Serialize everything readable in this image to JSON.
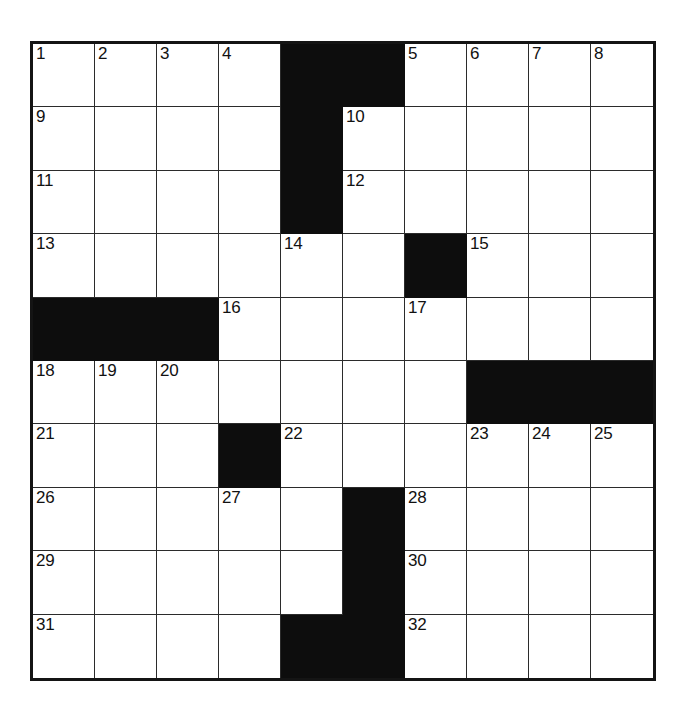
{
  "puzzle": {
    "title": "Crossword Grid",
    "type": "crossword-grid",
    "columns": 10,
    "rows": 10,
    "total_clue_numbers": 32,
    "colors": {
      "cell_fill": "#ffffff",
      "block_fill": "#0d0d0d",
      "grid_line": "#2b2b2b",
      "border": "#141414",
      "number_text": "#111111",
      "page_background": "#ffffff"
    },
    "grid": [
      [
        {
          "block": false,
          "number": "1"
        },
        {
          "block": false,
          "number": "2"
        },
        {
          "block": false,
          "number": "3"
        },
        {
          "block": false,
          "number": "4"
        },
        {
          "block": true,
          "number": ""
        },
        {
          "block": true,
          "number": ""
        },
        {
          "block": false,
          "number": "5"
        },
        {
          "block": false,
          "number": "6"
        },
        {
          "block": false,
          "number": "7"
        },
        {
          "block": false,
          "number": "8"
        }
      ],
      [
        {
          "block": false,
          "number": "9"
        },
        {
          "block": false,
          "number": ""
        },
        {
          "block": false,
          "number": ""
        },
        {
          "block": false,
          "number": ""
        },
        {
          "block": true,
          "number": ""
        },
        {
          "block": false,
          "number": "10"
        },
        {
          "block": false,
          "number": ""
        },
        {
          "block": false,
          "number": ""
        },
        {
          "block": false,
          "number": ""
        },
        {
          "block": false,
          "number": ""
        }
      ],
      [
        {
          "block": false,
          "number": "11"
        },
        {
          "block": false,
          "number": ""
        },
        {
          "block": false,
          "number": ""
        },
        {
          "block": false,
          "number": ""
        },
        {
          "block": true,
          "number": ""
        },
        {
          "block": false,
          "number": "12"
        },
        {
          "block": false,
          "number": ""
        },
        {
          "block": false,
          "number": ""
        },
        {
          "block": false,
          "number": ""
        },
        {
          "block": false,
          "number": ""
        }
      ],
      [
        {
          "block": false,
          "number": "13"
        },
        {
          "block": false,
          "number": ""
        },
        {
          "block": false,
          "number": ""
        },
        {
          "block": false,
          "number": ""
        },
        {
          "block": false,
          "number": "14"
        },
        {
          "block": false,
          "number": ""
        },
        {
          "block": true,
          "number": ""
        },
        {
          "block": false,
          "number": "15"
        },
        {
          "block": false,
          "number": ""
        },
        {
          "block": false,
          "number": ""
        }
      ],
      [
        {
          "block": true,
          "number": ""
        },
        {
          "block": true,
          "number": ""
        },
        {
          "block": true,
          "number": ""
        },
        {
          "block": false,
          "number": "16"
        },
        {
          "block": false,
          "number": ""
        },
        {
          "block": false,
          "number": ""
        },
        {
          "block": false,
          "number": "17"
        },
        {
          "block": false,
          "number": ""
        },
        {
          "block": false,
          "number": ""
        },
        {
          "block": false,
          "number": ""
        }
      ],
      [
        {
          "block": false,
          "number": "18"
        },
        {
          "block": false,
          "number": "19"
        },
        {
          "block": false,
          "number": "20"
        },
        {
          "block": false,
          "number": ""
        },
        {
          "block": false,
          "number": ""
        },
        {
          "block": false,
          "number": ""
        },
        {
          "block": false,
          "number": ""
        },
        {
          "block": true,
          "number": ""
        },
        {
          "block": true,
          "number": ""
        },
        {
          "block": true,
          "number": ""
        }
      ],
      [
        {
          "block": false,
          "number": "21"
        },
        {
          "block": false,
          "number": ""
        },
        {
          "block": false,
          "number": ""
        },
        {
          "block": true,
          "number": ""
        },
        {
          "block": false,
          "number": "22"
        },
        {
          "block": false,
          "number": ""
        },
        {
          "block": false,
          "number": ""
        },
        {
          "block": false,
          "number": "23"
        },
        {
          "block": false,
          "number": "24"
        },
        {
          "block": false,
          "number": "25"
        }
      ],
      [
        {
          "block": false,
          "number": "26"
        },
        {
          "block": false,
          "number": ""
        },
        {
          "block": false,
          "number": ""
        },
        {
          "block": false,
          "number": "27"
        },
        {
          "block": false,
          "number": ""
        },
        {
          "block": true,
          "number": ""
        },
        {
          "block": false,
          "number": "28"
        },
        {
          "block": false,
          "number": ""
        },
        {
          "block": false,
          "number": ""
        },
        {
          "block": false,
          "number": ""
        }
      ],
      [
        {
          "block": false,
          "number": "29"
        },
        {
          "block": false,
          "number": ""
        },
        {
          "block": false,
          "number": ""
        },
        {
          "block": false,
          "number": ""
        },
        {
          "block": false,
          "number": ""
        },
        {
          "block": true,
          "number": ""
        },
        {
          "block": false,
          "number": "30"
        },
        {
          "block": false,
          "number": ""
        },
        {
          "block": false,
          "number": ""
        },
        {
          "block": false,
          "number": ""
        }
      ],
      [
        {
          "block": false,
          "number": "31"
        },
        {
          "block": false,
          "number": ""
        },
        {
          "block": false,
          "number": ""
        },
        {
          "block": false,
          "number": ""
        },
        {
          "block": true,
          "number": ""
        },
        {
          "block": true,
          "number": ""
        },
        {
          "block": false,
          "number": "32"
        },
        {
          "block": false,
          "number": ""
        },
        {
          "block": false,
          "number": ""
        },
        {
          "block": false,
          "number": ""
        }
      ]
    ]
  }
}
